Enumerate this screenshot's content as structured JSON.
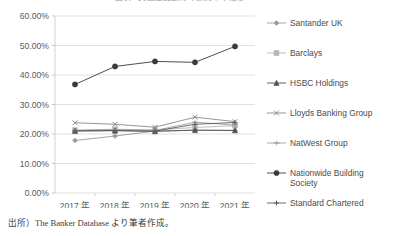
{
  "chart_data": {
    "type": "line",
    "title": "図表6 英国主要銀行の預貸率の推移",
    "xlabel": "",
    "ylabel": "",
    "categories": [
      "2017 年",
      "2018 年",
      "2019 年",
      "2020 年",
      "2021 年"
    ],
    "x_tick_labels": [
      "2017 年",
      "2018 年",
      "2019 年",
      "2020 年",
      "2021 年"
    ],
    "y_tick_labels": [
      "0.00%",
      "10.00%",
      "20.00%",
      "30.00%",
      "40.00%",
      "50.00%",
      "60.00%"
    ],
    "y_ticks": [
      0,
      10,
      20,
      30,
      40,
      50,
      60
    ],
    "ylim": [
      0,
      60
    ],
    "y_unit": "%",
    "grid": "horizontal",
    "legend_position": "right",
    "series": [
      {
        "name": "Santander UK",
        "marker": "diamond",
        "color": "#9a9a9a",
        "values": [
          17.8,
          19.3,
          21.0,
          21.3,
          21.2
        ]
      },
      {
        "name": "Barclays",
        "marker": "square",
        "color": "#b5b5b5",
        "values": [
          21.3,
          21.6,
          21.4,
          22.2,
          22.8
        ]
      },
      {
        "name": "HSBC Holdings",
        "marker": "triangle",
        "color": "#4f4f4f",
        "values": [
          21.0,
          21.1,
          20.9,
          21.3,
          21.2
        ]
      },
      {
        "name": "Lloyds Banking Group",
        "marker": "x",
        "color": "#8a8a8a",
        "values": [
          23.8,
          23.3,
          22.3,
          25.7,
          24.2
        ]
      },
      {
        "name": "NatWest Group",
        "marker": "dash",
        "color": "#a0a0a0",
        "values": [
          21.2,
          21.5,
          21.2,
          24.0,
          23.0
        ]
      },
      {
        "name": "Nationwide Building\nSociety",
        "marker": "circle",
        "color": "#3a3a3a",
        "values": [
          36.8,
          42.9,
          44.6,
          44.3,
          49.7
        ]
      },
      {
        "name": "Standard Chartered",
        "marker": "plus",
        "color": "#5a5a5a",
        "values": [
          21.1,
          21.2,
          21.0,
          23.3,
          23.9
        ]
      }
    ]
  },
  "legend": {
    "items": [
      {
        "label": "Santander UK"
      },
      {
        "label": "Barclays"
      },
      {
        "label": "HSBC Holdings"
      },
      {
        "label": "Lloyds Banking Group"
      },
      {
        "label": "NatWest Group"
      },
      {
        "label": "Nationwide Building\nSociety"
      },
      {
        "label": "Standard Chartered"
      }
    ]
  },
  "footer": {
    "source_note": "出所）The Banker Database より筆者作成。"
  }
}
